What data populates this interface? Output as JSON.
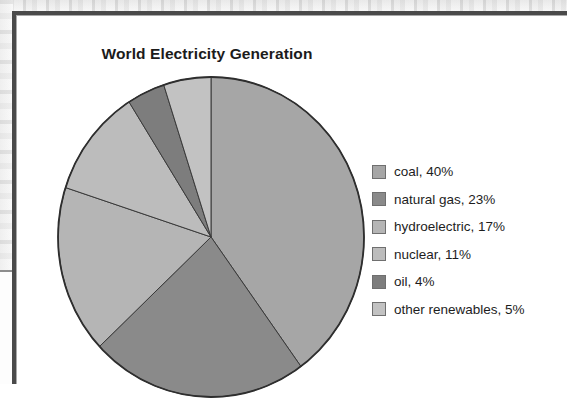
{
  "figure": {
    "title": "World Electricity Generation",
    "frame_color": "#4a4a4a",
    "panel_background": "#ffffff"
  },
  "chart_data": {
    "type": "pie",
    "title": "World Electricity Generation",
    "xlabel": "",
    "ylabel": "",
    "legend_position": "right",
    "grid": false,
    "start_angle_deg": 0,
    "direction": "clockwise",
    "units": "percent",
    "categories": [
      "coal",
      "natural gas",
      "hydroelectric",
      "nuclear",
      "oil",
      "other renewables"
    ],
    "values": [
      40,
      23,
      17,
      11,
      4,
      5
    ],
    "colors": [
      "#a6a6a6",
      "#8a8a8a",
      "#b5b5b5",
      "#bcbcbc",
      "#7d7d7d",
      "#c2c2c2"
    ],
    "slice_outline_color": "#3a3a3a",
    "labels": [
      "coal, 40%",
      "natural gas, 23%",
      "hydroelectric, 17%",
      "nuclear, 11%",
      "oil, 4%",
      "other renewables, 5%"
    ]
  },
  "legend": {
    "items": [
      {
        "label": "coal, 40%",
        "color": "#a6a6a6",
        "value": 40,
        "name": "coal"
      },
      {
        "label": "natural gas, 23%",
        "color": "#8a8a8a",
        "value": 23,
        "name": "natural gas"
      },
      {
        "label": "hydroelectric, 17%",
        "color": "#b5b5b5",
        "value": 17,
        "name": "hydroelectric"
      },
      {
        "label": "nuclear, 11%",
        "color": "#bcbcbc",
        "value": 11,
        "name": "nuclear"
      },
      {
        "label": "oil, 4%",
        "color": "#7d7d7d",
        "value": 4,
        "name": "oil"
      },
      {
        "label": "other renewables, 5%",
        "color": "#c2c2c2",
        "value": 5,
        "name": "other renewables"
      }
    ]
  }
}
